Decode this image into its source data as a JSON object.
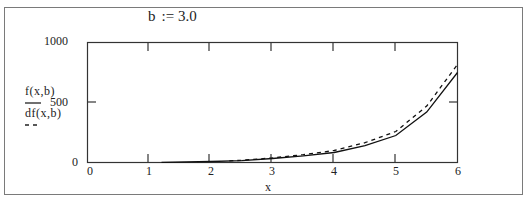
{
  "title": {
    "variable": "b",
    "operator": ":=",
    "value": "3.0"
  },
  "legend": [
    {
      "label": "f(x,b)",
      "style": "solid"
    },
    {
      "label": "df(x,b)",
      "style": "dashed"
    }
  ],
  "axes": {
    "xlabel": "x",
    "xticks": [
      "0",
      "1",
      "2",
      "3",
      "4",
      "5",
      "6"
    ],
    "yticks": [
      "1000",
      "500",
      "0"
    ]
  },
  "chart_data": {
    "type": "line",
    "xlabel": "x",
    "ylabel": "",
    "xlim": [
      0,
      6
    ],
    "ylim": [
      0,
      1000
    ],
    "xticks": [
      0,
      1,
      2,
      3,
      4,
      5,
      6
    ],
    "yticks": [
      0,
      500,
      1000
    ],
    "grid": false,
    "legend_position": "left",
    "series": [
      {
        "name": "f(x,b)",
        "style": "solid",
        "x": [
          1.2,
          2.0,
          2.5,
          3.0,
          3.5,
          4.0,
          4.5,
          5.0,
          5.5,
          6.0
        ],
        "y": [
          2,
          8,
          15,
          33,
          55,
          83,
          140,
          225,
          420,
          750
        ]
      },
      {
        "name": "df(x,b)",
        "style": "dashed",
        "x": [
          2.3,
          2.5,
          3.0,
          3.5,
          4.0,
          4.5,
          5.0,
          5.5,
          6.0
        ],
        "y": [
          14,
          18,
          38,
          65,
          100,
          165,
          258,
          470,
          817
        ]
      }
    ]
  }
}
